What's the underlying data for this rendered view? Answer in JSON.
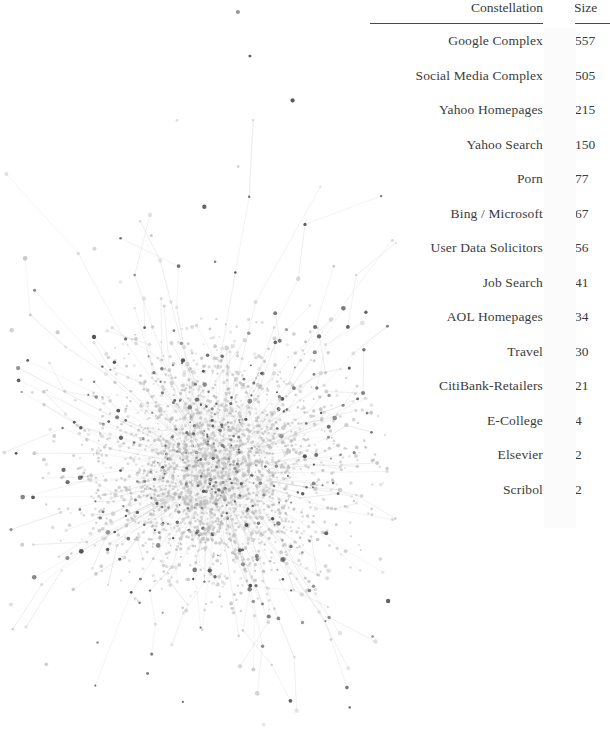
{
  "legend": {
    "headers": {
      "constellation": "Constellation",
      "size": "Size"
    },
    "rows": [
      {
        "constellation": "Google Complex",
        "size": "557",
        "color": "#c9c9c9"
      },
      {
        "constellation": "Social Media Complex",
        "size": "505",
        "color": "#c6c6c6"
      },
      {
        "constellation": "Yahoo Homepages",
        "size": "215",
        "color": "#bdbdbd"
      },
      {
        "constellation": "Yahoo Search",
        "size": "150",
        "color": "#4f4f4f"
      },
      {
        "constellation": "Porn",
        "size": "77",
        "color": "#c4c4c4"
      },
      {
        "constellation": "Bing / Microsoft",
        "size": "67",
        "color": "#a8a8a8"
      },
      {
        "constellation": "User Data Solicitors",
        "size": "56",
        "color": "#b0b0b0"
      },
      {
        "constellation": "Job Search",
        "size": "41",
        "color": "#cacaca"
      },
      {
        "constellation": "AOL Homepages",
        "size": "34",
        "color": "#c8c8c8"
      },
      {
        "constellation": "Travel",
        "size": "30",
        "color": "#cdcdcd"
      },
      {
        "constellation": "CitiBank-Retailers",
        "size": "21",
        "color": "#cfcfcf"
      },
      {
        "constellation": "E-College",
        "size": "4",
        "color": "#d2d2d2"
      },
      {
        "constellation": "Elsevier",
        "size": "2",
        "color": "#d6d6d6"
      },
      {
        "constellation": "Scribol",
        "size": "2",
        "color": "#dadada"
      }
    ]
  },
  "chart_data": {
    "type": "table",
    "columns": [
      "Constellation",
      "Color",
      "Size"
    ],
    "categories": [
      "Google Complex",
      "Social Media Complex",
      "Yahoo Homepages",
      "Yahoo Search",
      "Porn",
      "Bing / Microsoft",
      "User Data Solicitors",
      "Job Search",
      "AOL Homepages",
      "Travel",
      "CitiBank-Retailers",
      "E-College",
      "Elsevier",
      "Scribol"
    ],
    "values": [
      557,
      505,
      215,
      150,
      77,
      67,
      56,
      41,
      34,
      30,
      21,
      4,
      2,
      2
    ],
    "swatch_colors": [
      "#c9c9c9",
      "#c6c6c6",
      "#bdbdbd",
      "#4f4f4f",
      "#c4c4c4",
      "#a8a8a8",
      "#b0b0b0",
      "#cacaca",
      "#c8c8c8",
      "#cdcdcd",
      "#cfcfcf",
      "#d2d2d2",
      "#d6d6d6",
      "#dadada"
    ],
    "xlabel": "",
    "ylabel": "Size",
    "grid": false,
    "legend_position": "right"
  },
  "graph": {
    "type": "force-directed-network",
    "description": "Dense grayscale hairball network graph with a single large central cluster and radiating spoke edges to peripheral and isolated nodes",
    "center_x": 215,
    "center_y": 470,
    "core_radius": 105,
    "node_count_rendered": 2600,
    "edge_count_rendered": 470,
    "node_color_light": "#b5b5b5",
    "node_color_dark": "#4a4a4a",
    "edge_color": "#c9c9c9",
    "background": "#ffffff"
  }
}
